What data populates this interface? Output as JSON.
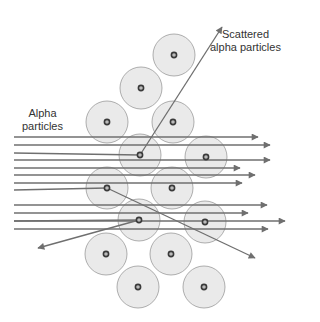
{
  "labels": {
    "incoming": [
      "Alpha",
      "particles"
    ],
    "scattered": [
      "Scattered",
      "alpha particles"
    ]
  },
  "colors": {
    "line": "#6f6f6f",
    "atom_fill": "#e6e6e6",
    "atom_stroke": "#9a9a9a",
    "nucleus": "#3a3a3a"
  },
  "atoms": [
    [
      174,
      55
    ],
    [
      141,
      88
    ],
    [
      107,
      122
    ],
    [
      173,
      122
    ],
    [
      140,
      155
    ],
    [
      206,
      157
    ],
    [
      107,
      188
    ],
    [
      172,
      188
    ],
    [
      139,
      220
    ],
    [
      205,
      222
    ],
    [
      106,
      254
    ],
    [
      171,
      254
    ],
    [
      138,
      287
    ],
    [
      204,
      287
    ]
  ],
  "straight_beams": [
    {
      "y": 137,
      "x_end": 258
    },
    {
      "y": 145,
      "x_end": 270
    },
    {
      "y": 160,
      "x_end": 270
    },
    {
      "y": 168,
      "x_end": 240
    },
    {
      "y": 175,
      "x_end": 255
    },
    {
      "y": 183,
      "x_end": 242
    },
    {
      "y": 205,
      "x_end": 267
    },
    {
      "y": 213,
      "x_end": 248
    },
    {
      "y": 221,
      "x_end": 285
    },
    {
      "y": 229,
      "x_end": 268
    }
  ],
  "deflected": [
    {
      "from": [
        14,
        153
      ],
      "via": [
        140,
        155
      ],
      "to": [
        222,
        27
      ]
    },
    {
      "from": [
        14,
        190
      ],
      "via": [
        107,
        188
      ],
      "to": [
        255,
        258
      ]
    },
    {
      "from": [
        14,
        221
      ],
      "via": [
        139,
        220
      ],
      "to": [
        38,
        248
      ]
    }
  ]
}
